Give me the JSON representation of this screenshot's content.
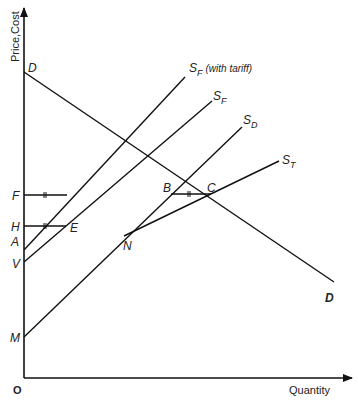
{
  "header": {
    "text": ""
  },
  "diagram": {
    "axes": {
      "y_label": "Price,Cost",
      "x_label": "Quantity",
      "origin_label": "O"
    },
    "curves": [
      {
        "id": "demand",
        "label": "D",
        "end_label": "D"
      },
      {
        "id": "sf_tariff",
        "label_main": "S",
        "label_sub": "F",
        "label_note": "(with tariff)"
      },
      {
        "id": "sf",
        "label_main": "S",
        "label_sub": "F"
      },
      {
        "id": "sd",
        "label_main": "S",
        "label_sub": "D"
      },
      {
        "id": "st",
        "label_main": "S",
        "label_sub": "T"
      }
    ],
    "points": {
      "D": "D",
      "F": "F",
      "H": "H",
      "A": "A",
      "V": "V",
      "M": "M",
      "E": "E",
      "N": "N",
      "B": "B",
      "C": "C"
    }
  }
}
